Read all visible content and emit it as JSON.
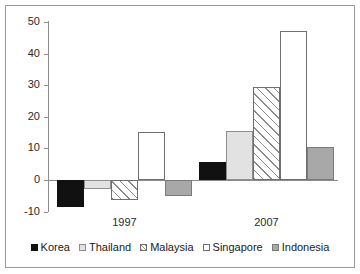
{
  "chart_data": {
    "type": "bar",
    "title": "",
    "xlabel": "",
    "ylabel": "Billions US dollars",
    "categories": [
      "1997",
      "2007"
    ],
    "ylim": [
      -10,
      50
    ],
    "yticks": [
      50,
      40,
      30,
      20,
      10,
      0,
      -10
    ],
    "ytick_labels": [
      "50",
      "40",
      "30",
      "20",
      "10",
      "0",
      "-10"
    ],
    "grid": false,
    "legend_position": "bottom",
    "series": [
      {
        "name": "Korea",
        "values": [
          -8.5,
          5.8
        ],
        "fill": "solid-black",
        "color": "#111111"
      },
      {
        "name": "Thailand",
        "values": [
          -3.0,
          15.5
        ],
        "fill": "light-gray",
        "color": "#e2e2e2"
      },
      {
        "name": "Malaysia",
        "values": [
          -6.3,
          29.5
        ],
        "fill": "diagonal-hatch",
        "color": "#ffffff"
      },
      {
        "name": "Singapore",
        "values": [
          15.3,
          47.0
        ],
        "fill": "white",
        "color": "#ffffff"
      },
      {
        "name": "Indonesia",
        "values": [
          -5.2,
          10.3
        ],
        "fill": "medium-gray",
        "color": "#a8a8a8"
      }
    ]
  },
  "axis": {
    "y_label": "Billions US dollars",
    "y_tick_labels": [
      "50",
      "40",
      "30",
      "20",
      "10",
      "0",
      "-10"
    ],
    "x_group_labels": [
      "1997",
      "2007"
    ]
  },
  "legend": {
    "entries": [
      {
        "label": "Korea"
      },
      {
        "label": "Thailand"
      },
      {
        "label": "Malaysia"
      },
      {
        "label": "Singapore"
      },
      {
        "label": "Indonesia"
      }
    ]
  }
}
